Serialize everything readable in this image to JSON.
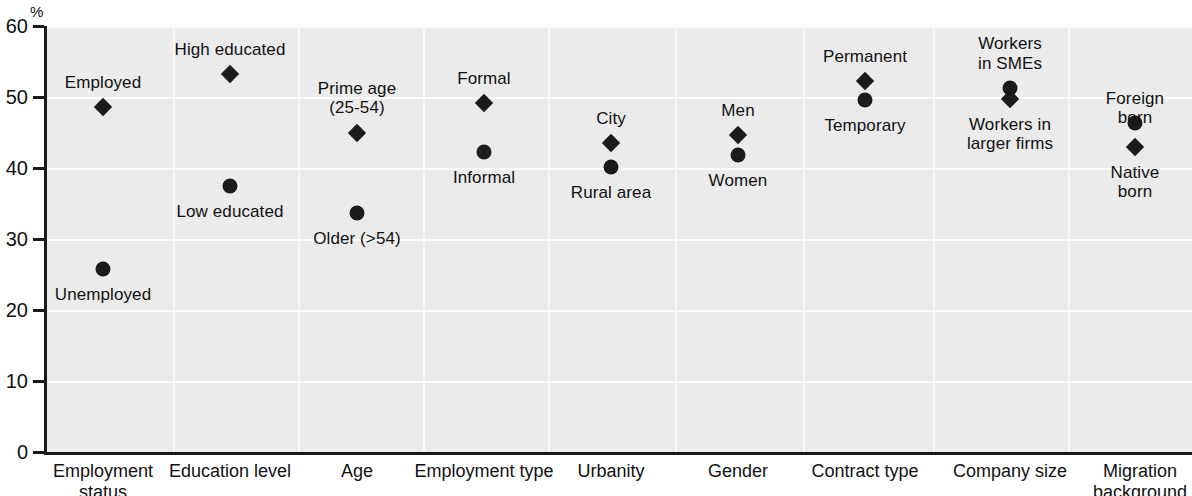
{
  "chart_data": {
    "type": "scatter",
    "title": "",
    "xlabel": "",
    "ylabel": "%",
    "ylim": [
      0,
      60
    ],
    "ytick_values": [
      0,
      10,
      20,
      30,
      40,
      50,
      60
    ],
    "ytick_labels": [
      "0",
      "10",
      "20",
      "30",
      "40",
      "50",
      "60"
    ],
    "grid": true,
    "legend": "none",
    "marker_colors": {
      "circle": "#1b1b1b",
      "diamond": "#1b1b1b"
    },
    "panel_color": "#ebebeb",
    "axis_color": "#1a1a1a",
    "categories": [
      "Employment\nstatus",
      "Education level",
      "Age",
      "Employment type",
      "Urbanity",
      "Gender",
      "Contract type",
      "Company size",
      "Migration\nbackground"
    ],
    "points": [
      {
        "category": "Employment status",
        "label": "Employed",
        "value": 48.6,
        "marker": "diamond",
        "label_position": "above"
      },
      {
        "category": "Employment status",
        "label": "Unemployed",
        "value": 25.8,
        "marker": "circle",
        "label_position": "below"
      },
      {
        "category": "Education level",
        "label": "High educated",
        "value": 53.3,
        "marker": "diamond",
        "label_position": "above"
      },
      {
        "category": "Education level",
        "label": "Low educated",
        "value": 37.5,
        "marker": "circle",
        "label_position": "below"
      },
      {
        "category": "Age",
        "label": "Prime age\n(25-54)",
        "value": 45.0,
        "marker": "diamond",
        "label_position": "above"
      },
      {
        "category": "Age",
        "label": "Older (>54)",
        "value": 33.7,
        "marker": "circle",
        "label_position": "below"
      },
      {
        "category": "Employment type",
        "label": "Formal",
        "value": 49.2,
        "marker": "diamond",
        "label_position": "above"
      },
      {
        "category": "Employment type",
        "label": "Informal",
        "value": 42.3,
        "marker": "circle",
        "label_position": "below"
      },
      {
        "category": "Urbanity",
        "label": "City",
        "value": 43.5,
        "marker": "diamond",
        "label_position": "above"
      },
      {
        "category": "Urbanity",
        "label": "Rural area",
        "value": 40.1,
        "marker": "circle",
        "label_position": "below"
      },
      {
        "category": "Gender",
        "label": "Men",
        "value": 44.6,
        "marker": "diamond",
        "label_position": "above"
      },
      {
        "category": "Gender",
        "label": "Women",
        "value": 41.8,
        "marker": "circle",
        "label_position": "below"
      },
      {
        "category": "Contract type",
        "label": "Permanent",
        "value": 52.3,
        "marker": "diamond",
        "label_position": "above"
      },
      {
        "category": "Contract type",
        "label": "Temporary",
        "value": 49.6,
        "marker": "circle",
        "label_position": "below"
      },
      {
        "category": "Company size",
        "label": "Workers\nin SMEs",
        "value": 51.2,
        "marker": "circle",
        "label_position": "above"
      },
      {
        "category": "Company size",
        "label": "Workers in\nlarger  firms",
        "value": 49.7,
        "marker": "diamond",
        "label_position": "below"
      },
      {
        "category": "Migration background",
        "label": "Foreign born",
        "value": 46.4,
        "marker": "circle",
        "label_position": "above"
      },
      {
        "category": "Migration background",
        "label": "Native born",
        "value": 42.9,
        "marker": "diamond",
        "label_position": "below"
      }
    ]
  },
  "layout": {
    "plot_left": 44,
    "plot_top": 26,
    "plot_width": 1146,
    "plot_height": 426,
    "category_centers": [
      103,
      230,
      357,
      484,
      611,
      738,
      865,
      1010,
      1135
    ],
    "category_label_centers": [
      103,
      230,
      357,
      484,
      611,
      738,
      865,
      1010,
      1140
    ],
    "group_boundaries": [
      170,
      295,
      420,
      545,
      672,
      800,
      930,
      1065
    ],
    "label_offsets_above": [
      -40,
      -40,
      -58,
      -40,
      -40,
      -40,
      -40,
      -58,
      -40
    ],
    "label_offsets_below": [
      34,
      34,
      34,
      34,
      34,
      34,
      34,
      34,
      34
    ]
  }
}
